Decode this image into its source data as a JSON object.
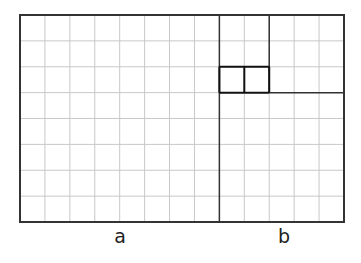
{
  "diagram": {
    "grid": {
      "left": 20,
      "top": 15,
      "right": 344,
      "bottom": 222,
      "cols": 13,
      "rows": 8
    },
    "divider_col": 8,
    "labels": {
      "a": "a",
      "b": "b"
    },
    "colors": {
      "grid": "#c8c8c8",
      "frame": "#333333",
      "highlight": "#111111"
    }
  }
}
